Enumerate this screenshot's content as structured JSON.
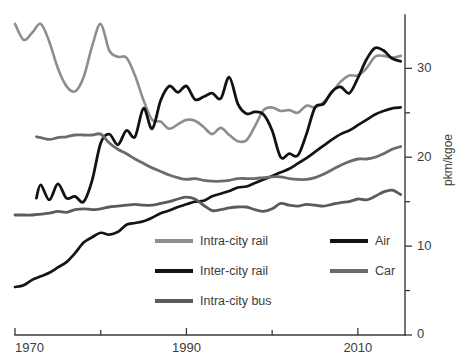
{
  "chart_data": {
    "type": "line",
    "title": "",
    "subtitle": "",
    "xlabel": "",
    "ylabel": "pkm/kgoe",
    "xlim": [
      1970,
      2015.5
    ],
    "ylim": [
      0,
      36
    ],
    "grid": false,
    "legend_position": "inside-bottom-center",
    "x_ticks_major": [
      1970,
      1990,
      2010
    ],
    "x_ticks_minor": [
      1980,
      2000
    ],
    "x_tick_labels": [
      "1970",
      "1990",
      "2010"
    ],
    "y_ticks_major": [
      0,
      10,
      20,
      30
    ],
    "y_ticks_minor": [
      5,
      15,
      25
    ],
    "y_tick_labels": [
      "0",
      "10",
      "20",
      "30"
    ],
    "series": [
      {
        "name": "Intra-city rail",
        "color": "#8e8e8e",
        "width": 2.6,
        "x": [
          1970,
          1971,
          1972,
          1973,
          1974,
          1975,
          1976,
          1977,
          1978,
          1979,
          1980,
          1981,
          1982,
          1983,
          1984,
          1985,
          1986,
          1987,
          1988,
          1989,
          1990,
          1991,
          1992,
          1993,
          1994,
          1995,
          1996,
          1997,
          1998,
          1999,
          2000,
          2001,
          2002,
          2003,
          2004,
          2005,
          2006,
          2007,
          2008,
          2009,
          2010,
          2011,
          2012,
          2013,
          2014,
          2015
        ],
        "values": [
          35.0,
          33.2,
          34.0,
          35.0,
          33.0,
          30.0,
          28.0,
          27.4,
          29.0,
          32.5,
          35.0,
          32.0,
          31.3,
          31.2,
          29.2,
          26.4,
          24.2,
          24.0,
          23.2,
          23.7,
          24.2,
          24.1,
          23.4,
          22.6,
          23.3,
          22.5,
          21.8,
          21.9,
          23.5,
          25.3,
          25.6,
          25.2,
          25.3,
          25.0,
          25.8,
          25.6,
          26.2,
          27.3,
          28.5,
          29.2,
          29.2,
          30.0,
          31.3,
          31.4,
          31.2,
          31.4
        ]
      },
      {
        "name": "Inter-city rail",
        "color": "#141414",
        "width": 2.7,
        "x": [
          1970,
          1971,
          1972,
          1973,
          1974,
          1975,
          1976,
          1977,
          1978,
          1979,
          1980,
          1981,
          1982,
          1983,
          1984,
          1985,
          1986,
          1987,
          1988,
          1989,
          1990,
          1991,
          1992,
          1993,
          1994,
          1995,
          1996,
          1997,
          1998,
          1999,
          2000,
          2001,
          2002,
          2003,
          2004,
          2005,
          2006,
          2007,
          2008,
          2009,
          2010,
          2011,
          2012,
          2013,
          2014,
          2015
        ],
        "values": [
          5.4,
          5.6,
          6.2,
          6.6,
          7.0,
          7.6,
          8.2,
          9.2,
          10.4,
          11.0,
          11.5,
          11.3,
          11.6,
          12.4,
          12.6,
          12.8,
          13.2,
          13.7,
          14.0,
          14.4,
          14.7,
          15.0,
          15.1,
          15.6,
          15.9,
          16.2,
          16.6,
          16.7,
          17.1,
          17.5,
          17.9,
          18.3,
          18.7,
          19.3,
          19.9,
          20.6,
          21.3,
          22.0,
          22.6,
          23.0,
          23.6,
          24.2,
          24.8,
          25.2,
          25.5,
          25.6
        ]
      },
      {
        "name": "Intra-city bus",
        "color": "#5b5b5b",
        "width": 2.8,
        "x": [
          1970,
          1971,
          1972,
          1973,
          1974,
          1975,
          1976,
          1977,
          1978,
          1979,
          1980,
          1981,
          1982,
          1983,
          1984,
          1985,
          1986,
          1987,
          1988,
          1989,
          1990,
          1991,
          1992,
          1993,
          1994,
          1995,
          1996,
          1997,
          1998,
          1999,
          2000,
          2001,
          2002,
          2003,
          2004,
          2005,
          2006,
          2007,
          2008,
          2009,
          2010,
          2011,
          2012,
          2013,
          2014,
          2015
        ],
        "values": [
          13.5,
          13.5,
          13.5,
          13.6,
          13.7,
          13.9,
          13.8,
          14.1,
          14.2,
          14.1,
          14.2,
          14.4,
          14.5,
          14.6,
          14.7,
          14.6,
          14.6,
          14.8,
          15.0,
          15.3,
          15.5,
          15.3,
          14.6,
          14.0,
          14.1,
          14.3,
          14.4,
          14.4,
          14.1,
          13.9,
          14.2,
          14.8,
          14.6,
          14.5,
          14.7,
          14.6,
          14.5,
          14.7,
          14.9,
          15.0,
          15.3,
          15.2,
          15.6,
          16.1,
          16.3,
          15.8
        ]
      },
      {
        "name": "Air",
        "color": "#121212",
        "width": 2.8,
        "x": [
          1972.5,
          1973,
          1974,
          1975,
          1976,
          1977,
          1978,
          1979,
          1980,
          1981,
          1982,
          1983,
          1984,
          1985,
          1986,
          1987,
          1988,
          1989,
          1990,
          1991,
          1992,
          1993,
          1994,
          1995,
          1996,
          1997,
          1998,
          1999,
          2000,
          2001,
          2002,
          2003,
          2004,
          2005,
          2006,
          2007,
          2008,
          2009,
          2010,
          2011,
          2012,
          2013,
          2014,
          2015
        ],
        "values": [
          15.4,
          16.9,
          15.2,
          17.0,
          15.4,
          15.6,
          15.0,
          17.4,
          21.6,
          22.6,
          21.4,
          23.0,
          22.3,
          25.5,
          23.2,
          26.4,
          28.0,
          27.3,
          28.0,
          26.5,
          26.8,
          27.2,
          26.6,
          29.0,
          26.0,
          24.9,
          25.1,
          24.8,
          23.0,
          20.0,
          20.4,
          20.2,
          22.6,
          25.6,
          26.0,
          27.4,
          27.9,
          27.2,
          28.9,
          31.0,
          32.3,
          32.0,
          31.1,
          30.8
        ]
      },
      {
        "name": "Car",
        "color": "#6b6b6b",
        "width": 2.8,
        "x": [
          1972.5,
          1973,
          1974,
          1975,
          1976,
          1977,
          1978,
          1979,
          1980,
          1981,
          1982,
          1983,
          1984,
          1985,
          1986,
          1987,
          1988,
          1989,
          1990,
          1991,
          1992,
          1993,
          1994,
          1995,
          1996,
          1997,
          1998,
          1999,
          2000,
          2001,
          2002,
          2003,
          2004,
          2005,
          2006,
          2007,
          2008,
          2009,
          2010,
          2011,
          2012,
          2013,
          2014,
          2015
        ],
        "values": [
          22.3,
          22.2,
          22.0,
          22.2,
          22.3,
          22.5,
          22.5,
          22.5,
          22.6,
          21.6,
          20.9,
          20.4,
          19.8,
          19.3,
          18.8,
          18.4,
          18.0,
          17.7,
          17.5,
          17.6,
          17.4,
          17.3,
          17.3,
          17.4,
          17.6,
          17.6,
          17.6,
          17.7,
          17.8,
          17.8,
          17.6,
          17.5,
          17.5,
          17.7,
          18.1,
          18.6,
          19.1,
          19.5,
          19.8,
          19.8,
          20.0,
          20.4,
          20.9,
          21.2
        ]
      }
    ],
    "legend": [
      {
        "label": "Intra-city rail",
        "color": "#8e8e8e"
      },
      {
        "label": "Inter-city rail",
        "color": "#141414"
      },
      {
        "label": "Intra-city bus",
        "color": "#5b5b5b"
      },
      {
        "label": "Air",
        "color": "#121212"
      },
      {
        "label": "Car",
        "color": "#6b6b6b"
      }
    ]
  },
  "axes": {
    "y_axis_title": "pkm/kgoe"
  }
}
